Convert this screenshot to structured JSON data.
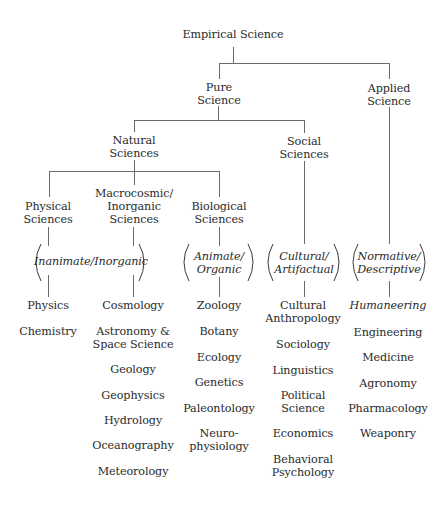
{
  "title": "Empirical Science",
  "nodes": {
    "pure": "Pure Science",
    "pure_l1": "Pure",
    "pure_l2": "Science",
    "applied_l1": "Applied",
    "applied_l2": "Science",
    "natural_l1": "Natural",
    "natural_l2": "Sciences",
    "social_l1": "Social",
    "social_l2": "Sciences",
    "physical_l1": "Physical",
    "physical_l2": "Sciences",
    "macro_l1": "Macrocosmic/",
    "macro_l2": "Inorganic",
    "macro_l3": "Sciences",
    "bio_l1": "Biological",
    "bio_l2": "Sciences"
  },
  "qualifiers": {
    "inanimate": "Inanimate/Inorganic",
    "animate_l1": "Animate/",
    "animate_l2": "Organic",
    "cultural_l1": "Cultural/",
    "cultural_l2": "Artifactual",
    "normative_l1": "Normative/",
    "normative_l2": "Descriptive"
  },
  "columns": {
    "physical": [
      "Physics",
      "Chemistry"
    ],
    "macro": [
      "Cosmology",
      "Astronomy &",
      "Space Science",
      "Geology",
      "Geophysics",
      "Hydrology",
      "Oceanography",
      "Meteorology"
    ],
    "bio": [
      "Zoology",
      "Botany",
      "Ecology",
      "Genetics",
      "Paleontology",
      "Neuro-",
      "physiology"
    ],
    "social": [
      "Cultural",
      "Anthropology",
      "Sociology",
      "Linguistics",
      "Political",
      "Science",
      "Economics",
      "Behavioral",
      "Psychology"
    ],
    "applied": [
      "Humaneering",
      "Engineering",
      "Medicine",
      "Agronomy",
      "Pharmacology",
      "Weaponry"
    ]
  }
}
